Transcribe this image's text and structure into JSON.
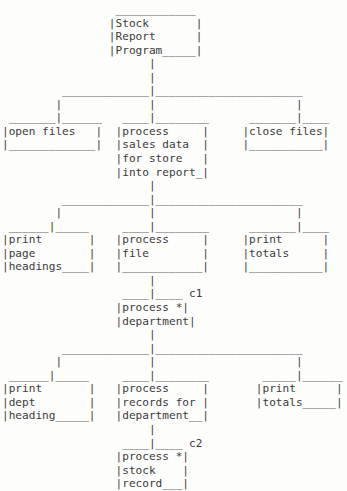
{
  "diagram": {
    "kind": "structure-chart",
    "style": "ascii-art",
    "colors": {
      "background": "#fdfdfc",
      "text": "#3a3a3a"
    },
    "nodes": [
      {
        "id": "root",
        "level": 0,
        "lines": [
          "Stock",
          "Report",
          "Program"
        ],
        "label": "Stock Report Program",
        "annotation": "",
        "asterisk": false
      },
      {
        "id": "open-files",
        "level": 1,
        "lines": [
          "open files",
          ""
        ],
        "label": "open files",
        "annotation": "",
        "asterisk": false
      },
      {
        "id": "process-sales-data",
        "level": 1,
        "lines": [
          "process",
          "sales data",
          "for store",
          "into report"
        ],
        "label": "process sales data for store into report",
        "annotation": "",
        "asterisk": false
      },
      {
        "id": "close-files",
        "level": 1,
        "lines": [
          "close files",
          ""
        ],
        "label": "close files",
        "annotation": "",
        "asterisk": false
      },
      {
        "id": "print-page-headings",
        "level": 2,
        "lines": [
          "print",
          "page",
          "headings"
        ],
        "label": "print page headings",
        "annotation": "",
        "asterisk": false
      },
      {
        "id": "process-file",
        "level": 2,
        "lines": [
          "process",
          "file",
          ""
        ],
        "label": "process file",
        "annotation": "",
        "asterisk": false
      },
      {
        "id": "print-totals-1",
        "level": 2,
        "lines": [
          "print",
          "totals",
          ""
        ],
        "label": "print totals",
        "annotation": "",
        "asterisk": false
      },
      {
        "id": "process-department",
        "level": 3,
        "lines": [
          "process    *",
          "department"
        ],
        "label": "process department",
        "annotation": "c1",
        "asterisk": true
      },
      {
        "id": "print-dept-heading",
        "level": 4,
        "lines": [
          "print",
          "dept",
          "heading"
        ],
        "label": "print dept heading",
        "annotation": "",
        "asterisk": false
      },
      {
        "id": "process-records-for-department",
        "level": 4,
        "lines": [
          "process",
          "records for",
          "department"
        ],
        "label": "process records for department",
        "annotation": "",
        "asterisk": false
      },
      {
        "id": "print-totals-2",
        "level": 4,
        "lines": [
          "print",
          "totals"
        ],
        "label": "print totals",
        "annotation": "",
        "asterisk": false
      },
      {
        "id": "process-stock-record",
        "level": 5,
        "lines": [
          "process    *",
          "stock",
          "record"
        ],
        "label": "process stock record",
        "annotation": "c2",
        "asterisk": true
      }
    ],
    "annotations": [
      {
        "id": "c1",
        "text": "c1",
        "attached_to": "process-department"
      },
      {
        "id": "c2",
        "text": "c2",
        "attached_to": "process-stock-record"
      }
    ],
    "ascii": "                 ____________\n                |Stock       |\n                |Report      |\n                |Program_____|\n                      |\n                      |\n         _____________|______________________\n        |             |                     |\n _______|______   ____|________      _______|____\n|open files   |  |process     |     |close files|\n|_____________|  |sales data  |     |___________|\n                 |for store   |\n                 |into report_|\n                      |\n         _____________|______________________\n        |             |                     |\n ______|_____     ____|________      _______|____\n|print       |   |process     |     |print      |\n|page        |   |file        |     |totals     |\n|headings____|   |____________|     |___________|\n                      |\n                  ____|____ c1\n                 |process *|\n                 |department|\n                      |\n         _____________|______________________\n        |             |                     |\n ______|_____     ____|________        _____|______\n|print       |   |process     |       |print      |\n|dept        |   |records for |       |totals_____|\n|heading_____|   |department__|\n                      |\n                  ____|____ c2\n                 |process *|\n                 |stock    |\n                 |record___|\n"
  }
}
